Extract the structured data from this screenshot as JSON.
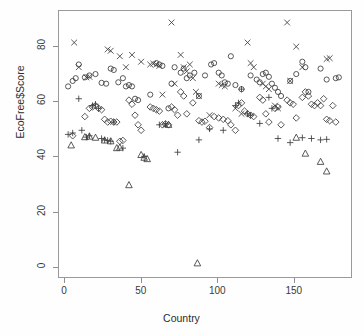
{
  "chart_data": {
    "type": "scatter",
    "title": "",
    "xlabel": "Country",
    "ylabel": "EcoFree$Score",
    "xlim": [
      -4,
      188
    ],
    "ylim": [
      -4,
      93
    ],
    "xticks": [
      0,
      50,
      100,
      150
    ],
    "xtick_labels": [
      "0",
      "50",
      "100",
      "150"
    ],
    "yticks": [
      0,
      20,
      40,
      60,
      80
    ],
    "ytick_labels": [
      "0",
      "20",
      "40",
      "60",
      "80"
    ],
    "grid": false,
    "legend": "none",
    "marker_color": "#3b3b3b",
    "frame_color": "#9a9a9a",
    "background": "#ffffff",
    "series": [
      {
        "name": "circle",
        "marker": "circle",
        "points": [
          [
            2,
            65.5
          ],
          [
            5,
            67.5
          ],
          [
            7,
            68.5
          ],
          [
            9,
            73.5
          ],
          [
            13,
            68.8
          ],
          [
            16,
            69.5
          ],
          [
            20,
            70.0
          ],
          [
            24,
            66.8
          ],
          [
            27,
            66.5
          ],
          [
            30,
            72.0
          ],
          [
            32,
            71.5
          ],
          [
            35,
            67.0
          ],
          [
            38,
            68.5
          ],
          [
            40,
            65.5
          ],
          [
            42,
            66.0
          ],
          [
            44,
            65.5
          ],
          [
            46,
            61.0
          ],
          [
            48,
            60.5
          ],
          [
            56,
            62.5
          ],
          [
            60,
            74.0
          ],
          [
            62,
            73.5
          ],
          [
            64,
            73.0
          ],
          [
            68,
            57.5
          ],
          [
            70,
            66.5
          ],
          [
            72,
            72.5
          ],
          [
            76,
            70.5
          ],
          [
            78,
            72.0
          ],
          [
            80,
            68.5
          ],
          [
            82,
            69.5
          ],
          [
            85,
            70.5
          ],
          [
            88,
            62.0
          ],
          [
            92,
            69.5
          ],
          [
            96,
            73.5
          ],
          [
            98,
            74.0
          ],
          [
            101,
            70.5
          ],
          [
            103,
            69.5
          ],
          [
            105,
            67.0
          ],
          [
            107,
            66.5
          ],
          [
            109,
            76.5
          ],
          [
            112,
            66.0
          ],
          [
            116,
            64.5
          ],
          [
            122,
            69.5
          ],
          [
            126,
            68.0
          ],
          [
            128,
            67.0
          ],
          [
            130,
            70.0
          ],
          [
            132,
            70.5
          ],
          [
            134,
            69.0
          ],
          [
            136,
            66.5
          ],
          [
            138,
            65.0
          ],
          [
            140,
            63.5
          ],
          [
            142,
            62.0
          ],
          [
            148,
            67.5
          ],
          [
            152,
            70.0
          ],
          [
            156,
            74.5
          ],
          [
            158,
            72.5
          ],
          [
            160,
            63.5
          ],
          [
            168,
            72.0
          ],
          [
            172,
            68.0
          ],
          [
            178,
            68.5
          ],
          [
            180,
            68.8
          ]
        ]
      },
      {
        "name": "plus",
        "marker": "plus",
        "points": [
          [
            2,
            48.0
          ],
          [
            5,
            48.5
          ],
          [
            9,
            61.0
          ],
          [
            11,
            49.5
          ],
          [
            14,
            47.0
          ],
          [
            16,
            47.5
          ],
          [
            18,
            58.5
          ],
          [
            20,
            59.0
          ],
          [
            22,
            57.5
          ],
          [
            24,
            46.5
          ],
          [
            26,
            46.0
          ],
          [
            28,
            45.8
          ],
          [
            30,
            45.5
          ],
          [
            32,
            52.5
          ],
          [
            38,
            43.0
          ],
          [
            52,
            40.0
          ],
          [
            62,
            51.5
          ],
          [
            66,
            51.8
          ],
          [
            74,
            41.5
          ],
          [
            88,
            46.0
          ],
          [
            95,
            50.0
          ],
          [
            104,
            49.5
          ],
          [
            112,
            58.5
          ],
          [
            114,
            59.5
          ],
          [
            116,
            64.5
          ],
          [
            120,
            55.5
          ],
          [
            122,
            55.0
          ],
          [
            128,
            52.0
          ],
          [
            134,
            61.5
          ],
          [
            136,
            57.5
          ],
          [
            140,
            46.5
          ],
          [
            148,
            45.0
          ],
          [
            156,
            46.8
          ],
          [
            162,
            46.5
          ],
          [
            168,
            46.0
          ],
          [
            172,
            46.2
          ]
        ]
      },
      {
        "name": "triangle",
        "marker": "triangle",
        "points": [
          [
            4,
            44.0
          ],
          [
            13,
            47.0
          ],
          [
            16,
            47.2
          ],
          [
            20,
            46.8
          ],
          [
            26,
            45.8
          ],
          [
            30,
            45.5
          ],
          [
            34,
            43.0
          ],
          [
            36,
            43.2
          ],
          [
            42,
            29.5
          ],
          [
            50,
            40.5
          ],
          [
            52,
            39.5
          ],
          [
            54,
            39.0
          ],
          [
            68,
            51.5
          ],
          [
            87,
            1.0
          ],
          [
            152,
            46.8
          ],
          [
            158,
            41.0
          ],
          [
            168,
            38.0
          ],
          [
            172,
            34.5
          ]
        ]
      },
      {
        "name": "cross",
        "marker": "cross",
        "points": [
          [
            6,
            81.5
          ],
          [
            9,
            72.5
          ],
          [
            14,
            68.8
          ],
          [
            16,
            69.0
          ],
          [
            28,
            79.0
          ],
          [
            30,
            78.5
          ],
          [
            36,
            76.5
          ],
          [
            40,
            72.5
          ],
          [
            44,
            77.0
          ],
          [
            50,
            74.5
          ],
          [
            56,
            73.5
          ],
          [
            58,
            73.8
          ],
          [
            60,
            73.5
          ],
          [
            62,
            73.0
          ],
          [
            64,
            62.5
          ],
          [
            66,
            51.5
          ],
          [
            70,
            88.8
          ],
          [
            72,
            66.5
          ],
          [
            76,
            77.0
          ],
          [
            78,
            72.5
          ],
          [
            80,
            71.0
          ],
          [
            82,
            73.5
          ],
          [
            84,
            68.5
          ],
          [
            86,
            63.5
          ],
          [
            88,
            62.0
          ],
          [
            95,
            55.0
          ],
          [
            101,
            66.5
          ],
          [
            103,
            66.0
          ],
          [
            105,
            65.5
          ],
          [
            112,
            57.5
          ],
          [
            116,
            55.5
          ],
          [
            120,
            81.5
          ],
          [
            122,
            74.0
          ],
          [
            124,
            72.5
          ],
          [
            130,
            66.5
          ],
          [
            132,
            65.5
          ],
          [
            134,
            64.5
          ],
          [
            138,
            58.5
          ],
          [
            140,
            57.5
          ],
          [
            146,
            88.8
          ],
          [
            148,
            67.5
          ],
          [
            152,
            80.0
          ],
          [
            156,
            72.5
          ],
          [
            172,
            75.5
          ],
          [
            174,
            75.8
          ]
        ]
      },
      {
        "name": "diamond",
        "marker": "diamond",
        "points": [
          [
            5,
            47.5
          ],
          [
            13,
            54.5
          ],
          [
            16,
            57.5
          ],
          [
            18,
            58.0
          ],
          [
            20,
            58.5
          ],
          [
            22,
            57.5
          ],
          [
            24,
            57.0
          ],
          [
            26,
            53.5
          ],
          [
            28,
            52.5
          ],
          [
            30,
            52.8
          ],
          [
            32,
            52.5
          ],
          [
            34,
            52.5
          ],
          [
            36,
            45.5
          ],
          [
            38,
            45.8
          ],
          [
            42,
            60.5
          ],
          [
            44,
            59.0
          ],
          [
            46,
            55.0
          ],
          [
            48,
            51.5
          ],
          [
            50,
            49.5
          ],
          [
            56,
            58.0
          ],
          [
            58,
            57.5
          ],
          [
            60,
            57.0
          ],
          [
            62,
            56.5
          ],
          [
            64,
            51.5
          ],
          [
            66,
            51.8
          ],
          [
            68,
            51.5
          ],
          [
            70,
            58.0
          ],
          [
            72,
            57.0
          ],
          [
            74,
            55.0
          ],
          [
            76,
            63.5
          ],
          [
            78,
            62.0
          ],
          [
            80,
            55.5
          ],
          [
            84,
            59.5
          ],
          [
            88,
            53.0
          ],
          [
            90,
            52.5
          ],
          [
            92,
            52.8
          ],
          [
            95,
            50.5
          ],
          [
            98,
            54.5
          ],
          [
            101,
            54.0
          ],
          [
            104,
            53.5
          ],
          [
            107,
            53.0
          ],
          [
            109,
            51.5
          ],
          [
            112,
            49.5
          ],
          [
            114,
            58.5
          ],
          [
            116,
            59.5
          ],
          [
            118,
            56.5
          ],
          [
            120,
            55.5
          ],
          [
            122,
            55.0
          ],
          [
            124,
            54.5
          ],
          [
            128,
            61.5
          ],
          [
            130,
            60.5
          ],
          [
            132,
            55.5
          ],
          [
            134,
            52.5
          ],
          [
            138,
            57.5
          ],
          [
            140,
            58.0
          ],
          [
            142,
            51.5
          ],
          [
            146,
            60.5
          ],
          [
            148,
            59.5
          ],
          [
            150,
            59.0
          ],
          [
            152,
            54.0
          ],
          [
            156,
            61.5
          ],
          [
            158,
            63.5
          ],
          [
            160,
            62.0
          ],
          [
            162,
            59.0
          ],
          [
            164,
            58.5
          ],
          [
            166,
            59.5
          ],
          [
            168,
            58.5
          ],
          [
            170,
            61.0
          ],
          [
            172,
            53.5
          ],
          [
            174,
            53.0
          ],
          [
            176,
            58.5
          ],
          [
            178,
            52.5
          ]
        ]
      }
    ]
  }
}
